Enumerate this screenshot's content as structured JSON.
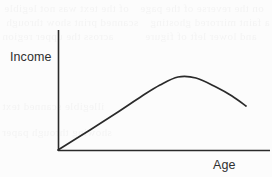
{
  "figure": {
    "y_axis_label": "Income",
    "x_axis_label": "Age",
    "line_color": "#2a2a2a",
    "background_color": "#fcfcfc",
    "label_color": "#2f2f2f"
  },
  "background_artifacts": {
    "description": "faint mirrored bleed-through text from reverse page",
    "lines": [
      "of the text was not legible",
      "on the reverse of the page",
      "scanned print show through",
      "a faint mirrored ghosting",
      "across the upper region",
      "and lower left of figure",
      "illegible scanned text",
      "showing through paper"
    ]
  },
  "chart_data": {
    "type": "line",
    "title": "",
    "subtitle": "",
    "xlabel": "Age",
    "ylabel": "Income",
    "grid": false,
    "legend": "none",
    "axis_arrows": false,
    "annotations": [],
    "xlim": [
      0,
      100
    ],
    "ylim": [
      0,
      100
    ],
    "xticks": [],
    "yticks": [],
    "shape": "inverted-u",
    "series": [
      {
        "name": "Income over age",
        "x": [
          0,
          10,
          20,
          30,
          40,
          50,
          55,
          60,
          70,
          80,
          90,
          100
        ],
        "y": [
          0,
          14,
          28,
          42,
          54,
          63,
          66,
          68,
          67,
          62,
          53,
          41
        ]
      }
    ],
    "peak": {
      "x": 62,
      "y": 68
    },
    "pixel_path": {
      "origin": [
        58,
        150
      ],
      "points": [
        [
          58,
          150
        ],
        [
          90,
          130
        ],
        [
          118,
          112
        ],
        [
          142,
          96
        ],
        [
          160,
          85
        ],
        [
          178,
          77
        ],
        [
          196,
          78
        ],
        [
          216,
          87
        ],
        [
          232,
          96
        ],
        [
          246,
          106
        ]
      ],
      "y_axis": {
        "x": 58,
        "y_top": 30,
        "y_bottom": 151
      },
      "x_axis": {
        "y": 150,
        "x_left": 58,
        "x_right": 270
      }
    }
  }
}
